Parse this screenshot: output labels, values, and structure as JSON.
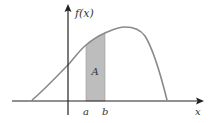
{
  "diagram": {
    "y_axis_label": "f(x)",
    "x_axis_label": "x",
    "region_label": "A",
    "lower_bound_label": "a",
    "upper_bound_label": "b"
  },
  "colors": {
    "background": "#ffffff",
    "axis": "#222222",
    "curve": "#8a8a8a",
    "shaded_region": "#bdbdbd",
    "text": "#333333"
  },
  "geometry": {
    "x_axis": {
      "y": 101,
      "x_start": 12,
      "x_end": 204
    },
    "y_axis": {
      "x": 68,
      "y_start": 115,
      "y_end": 4
    },
    "curve_points": [
      [
        32,
        100
      ],
      [
        50,
        86
      ],
      [
        68,
        65
      ],
      [
        86,
        45
      ],
      [
        105,
        33
      ],
      [
        123,
        28
      ],
      [
        140,
        32
      ],
      [
        152,
        50
      ],
      [
        167,
        100
      ]
    ],
    "shaded": {
      "x_a": 86,
      "x_b": 105
    }
  }
}
